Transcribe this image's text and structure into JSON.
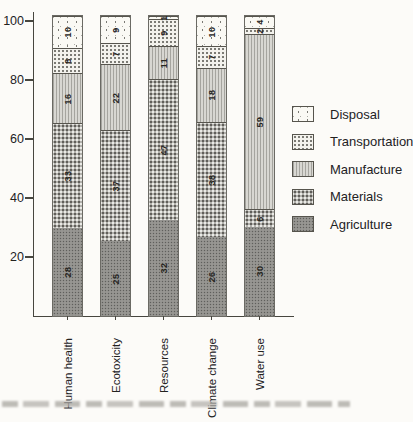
{
  "chart_data": {
    "type": "bar",
    "variant": "stacked-percentage",
    "title": "",
    "xlabel": "",
    "ylabel": "",
    "categories": [
      "Human health",
      "Ecotoxicity",
      "Resources",
      "Climate change",
      "Water use"
    ],
    "series": [
      {
        "name": "Agriculture",
        "values": [
          28,
          25,
          32,
          26,
          30
        ]
      },
      {
        "name": "Materials",
        "values": [
          33,
          37,
          47,
          38,
          6
        ]
      },
      {
        "name": "Manufacture",
        "values": [
          16,
          22,
          11,
          18,
          59
        ]
      },
      {
        "name": "Transportation",
        "values": [
          8,
          7,
          9,
          7,
          2
        ]
      },
      {
        "name": "Disposal",
        "values": [
          10,
          9,
          1,
          10,
          4
        ]
      }
    ],
    "stack_order_bottom_to_top": [
      "Agriculture",
      "Materials",
      "Manufacture",
      "Transportation",
      "Disposal"
    ],
    "legend_order_top_to_bottom": [
      "Disposal",
      "Transportation",
      "Manufacture",
      "Materials",
      "Agriculture"
    ],
    "yticks": [
      100,
      80,
      60,
      40,
      20
    ],
    "ylim": [
      0,
      100
    ],
    "grid": false,
    "legend_position": "right",
    "value_labels": "inside segments, rotated 90 degrees"
  },
  "colors": {
    "agriculture": "#908f8b",
    "materials": "#b2b1ac",
    "manufacture": "#d8d7d2",
    "transportation": "#f3f2ed",
    "disposal": "#faf9f4",
    "axis": "#47463f",
    "text": "#23221f",
    "background": "#fcfbf8"
  }
}
